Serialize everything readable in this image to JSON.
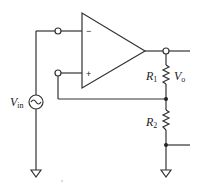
{
  "diagram": {
    "type": "non-inverting op-amp circuit with voltage divider feedback",
    "opamp": {
      "inverting_sign": "−",
      "noninverting_sign": "+"
    },
    "source": {
      "label_main": "V",
      "label_sub": "in",
      "symbol": "ac-source-icon"
    },
    "resistors": [
      {
        "label_main": "R",
        "label_sub": "1"
      },
      {
        "label_main": "R",
        "label_sub": "2"
      }
    ],
    "output": {
      "label_main": "V",
      "label_sub": "o"
    },
    "grounds": 2,
    "colors": {
      "wire": "#333333",
      "background": "#ffffff"
    }
  }
}
